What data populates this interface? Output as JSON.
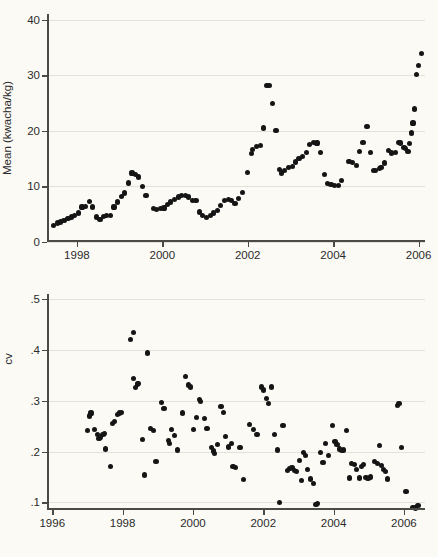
{
  "figure": {
    "background_color": "#fbfaf5",
    "marker_color": "#151515",
    "grid_color": "#e3e1da",
    "axis_color": "#4a4a46"
  },
  "chart_data": [
    {
      "type": "scatter",
      "id": "mean-price-panel",
      "title": "",
      "xlabel": "",
      "ylabel": "Mean (kwacha/kg)",
      "xlim": [
        1997.3,
        2006.15
      ],
      "ylim": [
        0,
        41
      ],
      "grid": true,
      "legend": "none",
      "xticks": [
        1998,
        2000,
        2002,
        2004,
        2006
      ],
      "xticklabels": [
        "1998",
        "2000",
        "2002",
        "2004",
        "2006"
      ],
      "yticks": [
        0,
        10,
        20,
        30,
        40
      ],
      "yticklabels": [
        "0",
        "10",
        "20",
        "30",
        "40"
      ],
      "points": [
        [
          1997.45,
          2.9
        ],
        [
          1997.54,
          3.4
        ],
        [
          1997.62,
          3.6
        ],
        [
          1997.7,
          3.9
        ],
        [
          1997.79,
          4.2
        ],
        [
          1997.87,
          4.5
        ],
        [
          1997.95,
          4.8
        ],
        [
          1998.04,
          5.2
        ],
        [
          1998.12,
          6.3
        ],
        [
          1998.2,
          6.4
        ],
        [
          1998.29,
          7.3
        ],
        [
          1998.37,
          6.3
        ],
        [
          1998.45,
          4.5
        ],
        [
          1998.54,
          4.1
        ],
        [
          1998.62,
          4.6
        ],
        [
          1998.7,
          4.7
        ],
        [
          1998.79,
          4.7
        ],
        [
          1998.87,
          6.3
        ],
        [
          1998.95,
          7.2
        ],
        [
          1999.04,
          8.2
        ],
        [
          1999.12,
          8.8
        ],
        [
          1999.2,
          10.6
        ],
        [
          1999.29,
          12.4
        ],
        [
          1999.37,
          12.1
        ],
        [
          1999.45,
          11.7
        ],
        [
          1999.54,
          10.0
        ],
        [
          1999.62,
          8.3
        ],
        [
          1999.79,
          6.0
        ],
        [
          1999.87,
          5.9
        ],
        [
          1999.95,
          6.0
        ],
        [
          2000.04,
          6.1
        ],
        [
          2000.12,
          6.7
        ],
        [
          2000.2,
          7.2
        ],
        [
          2000.29,
          7.6
        ],
        [
          2000.37,
          8.1
        ],
        [
          2000.45,
          8.4
        ],
        [
          2000.54,
          8.4
        ],
        [
          2000.62,
          8.1
        ],
        [
          2000.7,
          7.5
        ],
        [
          2000.79,
          7.4
        ],
        [
          2000.87,
          5.4
        ],
        [
          2000.95,
          4.7
        ],
        [
          2001.04,
          4.4
        ],
        [
          2001.12,
          4.7
        ],
        [
          2001.2,
          5.2
        ],
        [
          2001.29,
          5.7
        ],
        [
          2001.37,
          6.6
        ],
        [
          2001.45,
          7.4
        ],
        [
          2001.54,
          7.6
        ],
        [
          2001.62,
          7.5
        ],
        [
          2001.7,
          6.9
        ],
        [
          2001.79,
          7.8
        ],
        [
          2001.87,
          8.9
        ],
        [
          2002.0,
          12.5
        ],
        [
          2002.08,
          15.9
        ],
        [
          2002.12,
          16.6
        ],
        [
          2002.2,
          17.2
        ],
        [
          2002.29,
          17.3
        ],
        [
          2002.37,
          20.5
        ],
        [
          2002.45,
          28.2
        ],
        [
          2002.5,
          28.1
        ],
        [
          2002.58,
          24.9
        ],
        [
          2002.66,
          20.1
        ],
        [
          2002.75,
          13.0
        ],
        [
          2002.79,
          12.4
        ],
        [
          2002.87,
          12.9
        ],
        [
          2002.95,
          13.4
        ],
        [
          2003.04,
          13.6
        ],
        [
          2003.12,
          14.4
        ],
        [
          2003.2,
          15.0
        ],
        [
          2003.29,
          15.4
        ],
        [
          2003.37,
          16.1
        ],
        [
          2003.45,
          17.5
        ],
        [
          2003.54,
          17.9
        ],
        [
          2003.62,
          17.8
        ],
        [
          2003.7,
          16.1
        ],
        [
          2003.79,
          12.2
        ],
        [
          2003.87,
          10.5
        ],
        [
          2003.95,
          10.3
        ],
        [
          2004.04,
          10.2
        ],
        [
          2004.12,
          10.1
        ],
        [
          2004.2,
          11.0
        ],
        [
          2004.37,
          14.5
        ],
        [
          2004.45,
          14.3
        ],
        [
          2004.54,
          13.8
        ],
        [
          2004.62,
          16.3
        ],
        [
          2004.7,
          17.9
        ],
        [
          2004.79,
          20.8
        ],
        [
          2004.87,
          16.1
        ],
        [
          2004.95,
          12.9
        ],
        [
          2005.0,
          12.8
        ],
        [
          2005.08,
          13.2
        ],
        [
          2005.12,
          13.4
        ],
        [
          2005.2,
          14.2
        ],
        [
          2005.29,
          16.4
        ],
        [
          2005.37,
          16.0
        ],
        [
          2005.45,
          16.1
        ],
        [
          2005.54,
          17.9
        ],
        [
          2005.58,
          17.8
        ],
        [
          2005.66,
          17.0
        ],
        [
          2005.7,
          16.8
        ],
        [
          2005.75,
          16.3
        ],
        [
          2005.79,
          17.7
        ],
        [
          2005.83,
          19.6
        ],
        [
          2005.87,
          21.4
        ],
        [
          2005.91,
          23.9
        ],
        [
          2005.95,
          30.1
        ],
        [
          2006.0,
          31.8
        ],
        [
          2006.06,
          33.9
        ]
      ]
    },
    {
      "type": "scatter",
      "id": "cv-panel",
      "title": "",
      "xlabel": "",
      "ylabel": "cv",
      "xlim": [
        1995.85,
        2006.6
      ],
      "ylim": [
        0.085,
        0.51
      ],
      "grid": true,
      "legend": "none",
      "xticks": [
        1996,
        1998,
        2000,
        2002,
        2004,
        2006
      ],
      "xticklabels": [
        "1996",
        "1998",
        "2000",
        "2002",
        "2004",
        "2006"
      ],
      "yticks": [
        0.1,
        0.2,
        0.3,
        0.4,
        0.5
      ],
      "yticklabels": [
        ".1",
        ".2",
        ".3",
        ".4",
        ".5"
      ],
      "points": [
        [
          1997.0,
          0.241
        ],
        [
          1997.05,
          0.27
        ],
        [
          1997.1,
          0.276
        ],
        [
          1997.2,
          0.243
        ],
        [
          1997.28,
          0.233
        ],
        [
          1997.33,
          0.226
        ],
        [
          1997.38,
          0.227
        ],
        [
          1997.44,
          0.233
        ],
        [
          1997.49,
          0.236
        ],
        [
          1997.52,
          0.205
        ],
        [
          1997.66,
          0.17
        ],
        [
          1997.72,
          0.255
        ],
        [
          1997.77,
          0.259
        ],
        [
          1997.85,
          0.273
        ],
        [
          1997.92,
          0.276
        ],
        [
          1997.98,
          0.277
        ],
        [
          1998.22,
          0.42
        ],
        [
          1998.3,
          0.435
        ],
        [
          1998.32,
          0.344
        ],
        [
          1998.36,
          0.326
        ],
        [
          1998.42,
          0.333
        ],
        [
          1998.46,
          0.334
        ],
        [
          1998.56,
          0.224
        ],
        [
          1998.62,
          0.154
        ],
        [
          1998.7,
          0.394
        ],
        [
          1998.8,
          0.245
        ],
        [
          1998.88,
          0.242
        ],
        [
          1998.95,
          0.181
        ],
        [
          1999.1,
          0.297
        ],
        [
          1999.18,
          0.285
        ],
        [
          1999.3,
          0.222
        ],
        [
          1999.34,
          0.216
        ],
        [
          1999.4,
          0.243
        ],
        [
          1999.48,
          0.232
        ],
        [
          1999.56,
          0.203
        ],
        [
          1999.7,
          0.276
        ],
        [
          1999.8,
          0.347
        ],
        [
          1999.88,
          0.331
        ],
        [
          1999.93,
          0.327
        ],
        [
          2000.02,
          0.244
        ],
        [
          2000.1,
          0.267
        ],
        [
          2000.18,
          0.302
        ],
        [
          2000.22,
          0.299
        ],
        [
          2000.32,
          0.265
        ],
        [
          2000.4,
          0.245
        ],
        [
          2000.52,
          0.208
        ],
        [
          2000.58,
          0.201
        ],
        [
          2000.62,
          0.196
        ],
        [
          2000.7,
          0.214
        ],
        [
          2000.8,
          0.289
        ],
        [
          2000.86,
          0.277
        ],
        [
          2000.92,
          0.229
        ],
        [
          2001.02,
          0.209
        ],
        [
          2001.1,
          0.216
        ],
        [
          2001.14,
          0.171
        ],
        [
          2001.22,
          0.168
        ],
        [
          2001.34,
          0.208
        ],
        [
          2001.44,
          0.145
        ],
        [
          2001.6,
          0.253
        ],
        [
          2001.72,
          0.244
        ],
        [
          2001.82,
          0.234
        ],
        [
          2001.94,
          0.327
        ],
        [
          2002.0,
          0.321
        ],
        [
          2002.1,
          0.305
        ],
        [
          2002.16,
          0.295
        ],
        [
          2002.24,
          0.327
        ],
        [
          2002.32,
          0.234
        ],
        [
          2002.4,
          0.203
        ],
        [
          2002.46,
          0.1
        ],
        [
          2002.56,
          0.252
        ],
        [
          2002.7,
          0.163
        ],
        [
          2002.76,
          0.166
        ],
        [
          2002.82,
          0.168
        ],
        [
          2002.88,
          0.163
        ],
        [
          2002.94,
          0.16
        ],
        [
          2003.02,
          0.183
        ],
        [
          2003.08,
          0.143
        ],
        [
          2003.14,
          0.198
        ],
        [
          2003.2,
          0.192
        ],
        [
          2003.26,
          0.165
        ],
        [
          2003.34,
          0.146
        ],
        [
          2003.42,
          0.137
        ],
        [
          2003.5,
          0.096
        ],
        [
          2003.54,
          0.097
        ],
        [
          2003.62,
          0.198
        ],
        [
          2003.7,
          0.179
        ],
        [
          2003.78,
          0.216
        ],
        [
          2003.86,
          0.192
        ],
        [
          2003.96,
          0.252
        ],
        [
          2004.04,
          0.219
        ],
        [
          2004.1,
          0.214
        ],
        [
          2004.16,
          0.205
        ],
        [
          2004.22,
          0.202
        ],
        [
          2004.28,
          0.203
        ],
        [
          2004.36,
          0.241
        ],
        [
          2004.46,
          0.148
        ],
        [
          2004.52,
          0.177
        ],
        [
          2004.6,
          0.174
        ],
        [
          2004.66,
          0.164
        ],
        [
          2004.74,
          0.148
        ],
        [
          2004.8,
          0.171
        ],
        [
          2004.86,
          0.175
        ],
        [
          2004.92,
          0.149
        ],
        [
          2004.98,
          0.147
        ],
        [
          2005.06,
          0.15
        ],
        [
          2005.16,
          0.18
        ],
        [
          2005.24,
          0.176
        ],
        [
          2005.3,
          0.212
        ],
        [
          2005.36,
          0.172
        ],
        [
          2005.42,
          0.165
        ],
        [
          2005.48,
          0.16
        ],
        [
          2005.54,
          0.146
        ],
        [
          2005.82,
          0.291
        ],
        [
          2005.86,
          0.294
        ],
        [
          2005.94,
          0.208
        ],
        [
          2006.06,
          0.121
        ],
        [
          2006.26,
          0.09
        ],
        [
          2006.32,
          0.089
        ],
        [
          2006.4,
          0.094
        ]
      ]
    }
  ]
}
